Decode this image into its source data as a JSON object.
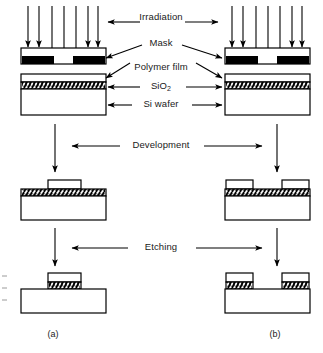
{
  "figure": {
    "captions": [
      {
        "id": "a",
        "text": "(a)",
        "x": 53,
        "y": 333,
        "resist": "negative"
      },
      {
        "id": "b",
        "text": "(b)",
        "x": 275,
        "y": 333,
        "resist": "positive"
      }
    ],
    "colors": {
      "line": "#000000",
      "mask_fill": "#000000",
      "background": "#ffffff",
      "oxide_hatch": "#000000"
    }
  },
  "labels": {
    "irradiation": "Irradiation",
    "mask": "Mask",
    "polymer_film": "Polymer film",
    "sio2": "SiO",
    "sio2_sub": "2",
    "si_wafer": "Si wafer",
    "development": "Development",
    "etching": "Etching"
  },
  "label_positions": {
    "irradiation": {
      "x": 161,
      "y": 18
    },
    "mask": {
      "x": 161,
      "y": 44
    },
    "polymer_film": {
      "x": 161,
      "y": 68
    },
    "sio2": {
      "x": 161,
      "y": 86
    },
    "si_wafer": {
      "x": 161,
      "y": 104
    },
    "development": {
      "x": 161,
      "y": 142
    },
    "etching": {
      "x": 161,
      "y": 244
    }
  },
  "stages": [
    {
      "name": "irradiation",
      "order": 1,
      "arrow_count_per_side": 6,
      "description": "UV light passes through mask openings onto polymer film"
    },
    {
      "name": "development",
      "order": 2,
      "description": "Exposed or unexposed polymer removed depending on resist tone"
    },
    {
      "name": "etching",
      "order": 3,
      "description": "Exposed SiO2 removed, leaving patterned oxide on Si wafer"
    }
  ],
  "columns": [
    {
      "id": "a",
      "resist_type": "negative",
      "after_development": "single central polymer block retained",
      "after_etching": "single central SiO2 island with polymer cap"
    },
    {
      "id": "b",
      "resist_type": "positive",
      "after_development": "two outer polymer blocks retained",
      "after_etching": "two outer SiO2 islands with polymer caps"
    }
  ]
}
